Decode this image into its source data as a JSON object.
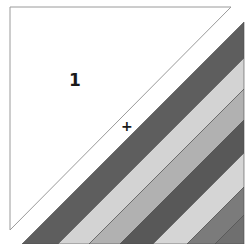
{
  "diagram": {
    "type": "quilt-block-layout",
    "piece_label": "1",
    "center_mark": "+",
    "triangle": {
      "points": [
        [
          10,
          7
        ],
        [
          231,
          7
        ],
        [
          10,
          230
        ]
      ],
      "fill": "#ffffff",
      "stroke": "#9a9a9a"
    },
    "stripes": [
      {
        "name": "stripe-1-dark",
        "from": 266,
        "to": 302,
        "color": "#5e5e5e"
      },
      {
        "name": "stripe-2-light",
        "from": 302,
        "to": 333,
        "color": "#d3d3d3"
      },
      {
        "name": "stripe-3-medium-light",
        "from": 333,
        "to": 364,
        "color": "#b1b1b1"
      },
      {
        "name": "stripe-4-dark",
        "from": 364,
        "to": 397,
        "color": "#585858"
      },
      {
        "name": "stripe-5-light",
        "from": 397,
        "to": 431,
        "color": "#d5d5d5"
      },
      {
        "name": "stripe-6-medium-dark",
        "from": 431,
        "to": 459,
        "color": "#7b7b7b"
      },
      {
        "name": "stripe-7-medium-dark",
        "from": 459,
        "to": 500,
        "color": "#6f6f6f"
      }
    ],
    "stripe_region": {
      "right": 244,
      "bottom": 244
    },
    "seam_color": "#4a4a4a"
  }
}
